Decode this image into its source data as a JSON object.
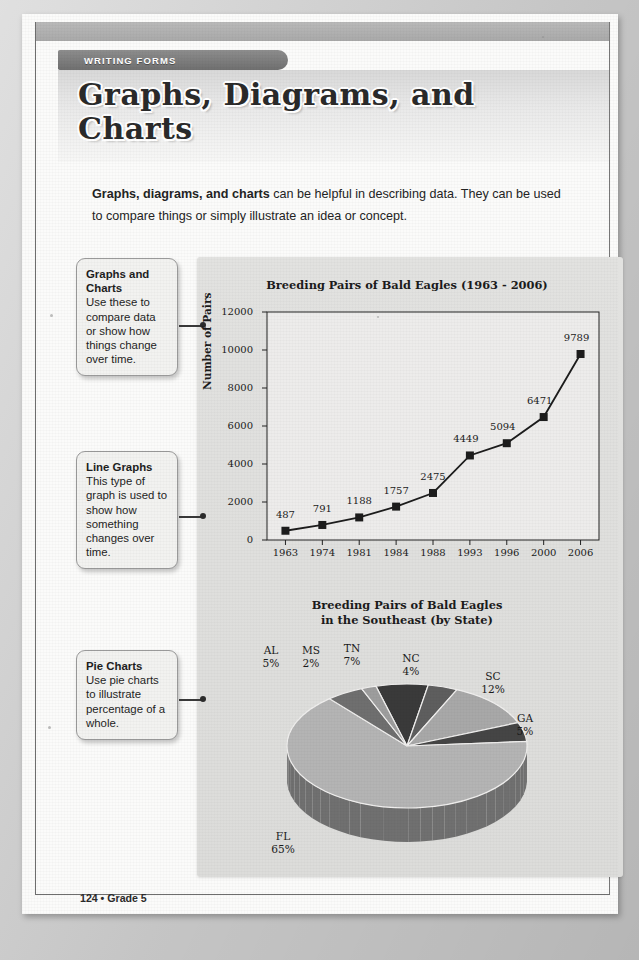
{
  "banner": {
    "label": "WRITING FORMS"
  },
  "title": {
    "line1": "Graphs, Diagrams, and",
    "line2": "Charts"
  },
  "intro": {
    "bold": "Graphs, diagrams, and charts",
    "rest": " can be helpful in describing data. They can be used to compare things or simply illustrate an idea or concept."
  },
  "callouts": [
    {
      "heading": "Graphs and Charts",
      "body": "Use these to compare data or show how things change over time."
    },
    {
      "heading": "Line Graphs",
      "body": "This type of graph is used to show how something changes over time."
    },
    {
      "heading": "Pie Charts",
      "body": "Use pie charts to illustrate percentage of a whole."
    }
  ],
  "footer": {
    "text": "124 • Grade 5"
  },
  "chart_data": [
    {
      "type": "line",
      "title": "Breeding Pairs of Bald Eagles (1963 - 2006)",
      "xlabel": "",
      "ylabel": "Number of Pairs",
      "categories": [
        "1963",
        "1974",
        "1981",
        "1984",
        "1988",
        "1993",
        "1996",
        "2000",
        "2006"
      ],
      "values": [
        487,
        791,
        1188,
        1757,
        2475,
        4449,
        5094,
        6471,
        9789
      ],
      "ylim": [
        0,
        12000
      ],
      "yticks": [
        0,
        2000,
        4000,
        6000,
        8000,
        10000,
        12000
      ],
      "ytick_labels": [
        "0",
        "2000",
        "4000",
        "6000",
        "8000",
        "10000",
        "12000"
      ],
      "data_labels": [
        "487",
        "791",
        "1188",
        "1757",
        "2475",
        "4449",
        "5094",
        "6471",
        "9789"
      ],
      "grid": false,
      "legend": "none",
      "marker": "square",
      "series_color": "#1c1c1c"
    },
    {
      "type": "pie",
      "title_line1": "Breeding Pairs of Bald Eagles",
      "title_line2": "in the Southeast (by State)",
      "labels": [
        "FL",
        "AL",
        "MS",
        "TN",
        "NC",
        "SC",
        "GA"
      ],
      "values": [
        65,
        5,
        2,
        7,
        4,
        12,
        5
      ],
      "value_labels": [
        "65%",
        "5%",
        "2%",
        "7%",
        "4%",
        "12%",
        "5%"
      ],
      "colors": [
        "#b4b4b4",
        "#6f6f6f",
        "#9d9d9d",
        "#3a3a3a",
        "#5e5e5e",
        "#a8a8a8",
        "#454545"
      ],
      "legend": "none",
      "style": "3d-exploded"
    }
  ]
}
